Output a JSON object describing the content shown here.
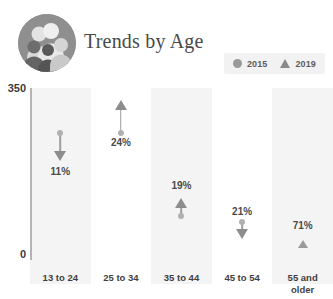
{
  "header": {
    "title": "Trends by Age",
    "avatar_icon": "group-of-people-avatar"
  },
  "legend": {
    "items": [
      {
        "label": "2015",
        "marker": "circle-marker"
      },
      {
        "label": "2019",
        "marker": "triangle-marker"
      }
    ]
  },
  "axis": {
    "max_label": "350",
    "min_label": "0"
  },
  "chart_data": {
    "type": "bar",
    "title": "Trends by Age",
    "xlabel": "",
    "ylabel": "",
    "ylim": [
      0,
      350
    ],
    "grid": false,
    "legend_position": "top-right",
    "categories": [
      "13 to 24",
      "25 to 34",
      "35 to 44",
      "45 to 54",
      "55 and older"
    ],
    "series": [
      {
        "name": "2015",
        "values": [
          221,
          221,
          87,
          78,
          42
        ]
      },
      {
        "name": "2019",
        "values": [
          197,
          274,
          104,
          62,
          72
        ]
      }
    ],
    "annotations": [
      {
        "category": "13 to 24",
        "label": "11%",
        "direction": "down"
      },
      {
        "category": "25 to 34",
        "label": "24%",
        "direction": "up"
      },
      {
        "category": "35 to 44",
        "label": "19%",
        "direction": "up"
      },
      {
        "category": "45 to 54",
        "label": "21%",
        "direction": "down"
      },
      {
        "category": "55 and older",
        "label": "71%",
        "direction": "up"
      }
    ]
  },
  "marks": [
    {
      "value": "11%",
      "direction": "down",
      "stem_top": 45,
      "stem_height": 22,
      "circle_y": 45,
      "head_y": 63,
      "label_y": 78,
      "band": "shaded",
      "small": false
    },
    {
      "value": "24%",
      "direction": "up",
      "stem_top": 18,
      "stem_height": 27,
      "circle_y": 45,
      "head_y": 12,
      "label_y": 49,
      "band": "plain",
      "small": false
    },
    {
      "value": "19%",
      "direction": "up",
      "stem_top": 116,
      "stem_height": 12,
      "circle_y": 128,
      "head_y": 110,
      "label_y": 92,
      "band": "shaded",
      "small": false
    },
    {
      "value": "21%",
      "direction": "down",
      "stem_top": 134,
      "stem_height": 8,
      "circle_y": 134,
      "head_y": 141,
      "label_y": 118,
      "band": "plain",
      "small": false
    },
    {
      "value": "71%",
      "direction": "up",
      "stem_top": 0,
      "stem_height": 0,
      "circle_y": -99,
      "head_y": 152,
      "label_y": 132,
      "band": "shaded",
      "small": true
    }
  ],
  "categories": [
    {
      "line1": "13 to 24",
      "line2": ""
    },
    {
      "line1": "25 to 34",
      "line2": ""
    },
    {
      "line1": "35 to 44",
      "line2": ""
    },
    {
      "line1": "45 to 54",
      "line2": ""
    },
    {
      "line1": "55 and",
      "line2": "older"
    }
  ],
  "colors": {
    "band": "#f4f4f4",
    "marker": "#8d8d8d",
    "circle": "#b0b0b0",
    "axis": "#b4b4b4",
    "text": "#3f3f3f",
    "title": "#4a4a4a"
  }
}
